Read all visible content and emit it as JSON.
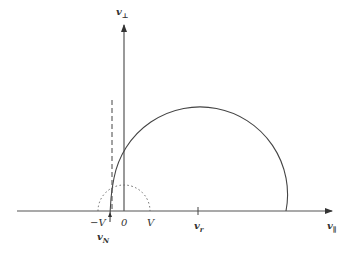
{
  "diagram": {
    "axes": {
      "x_label": "v",
      "x_sub": "∥",
      "y_label": "v",
      "y_sub": "⊥"
    },
    "ticks": {
      "minus_v": "−V",
      "zero": "0",
      "plus_v": "V",
      "v_r": "v",
      "v_r_sub": "r",
      "v_n": "v",
      "v_n_sub": "N"
    },
    "colors": {
      "axis": "#555555",
      "curve": "#444444",
      "dotted": "#666666"
    }
  }
}
